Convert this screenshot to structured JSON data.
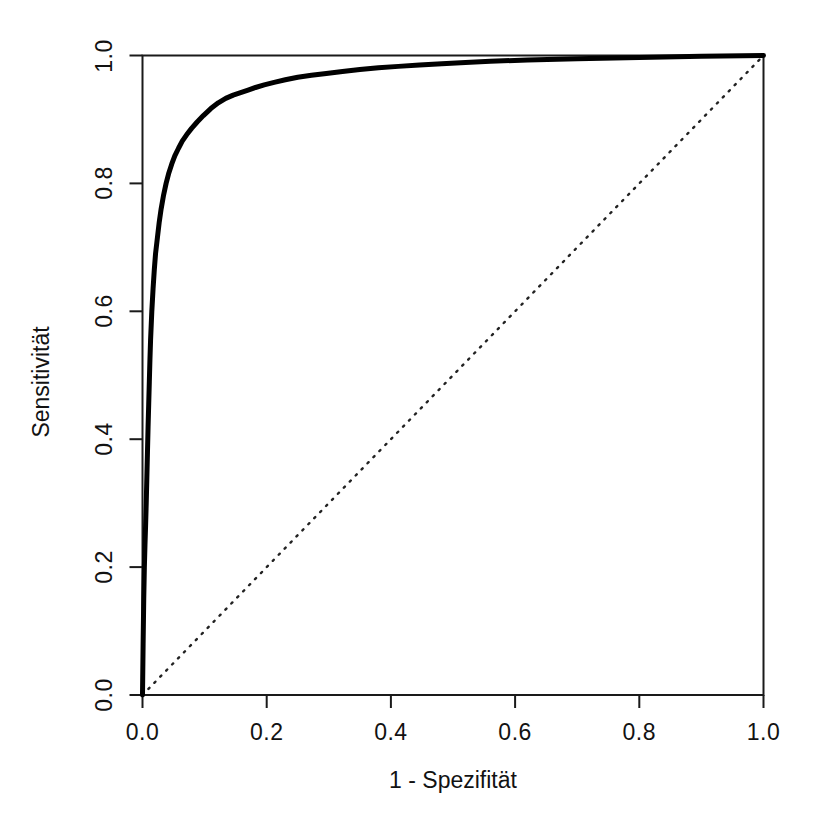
{
  "figure": {
    "background_color": "#ffffff",
    "foreground_color": "#121212"
  },
  "axes": {
    "x_title": "1 - Spezifität",
    "y_title": "Sensitivität",
    "x_ticks": [
      "0.0",
      "0.2",
      "0.4",
      "0.6",
      "0.8",
      "1.0"
    ],
    "y_ticks": [
      "0.0",
      "0.2",
      "0.4",
      "0.6",
      "0.8",
      "1.0"
    ]
  },
  "chart_data": {
    "type": "line",
    "title": "",
    "subtitle": "",
    "xlabel": "1 - Spezifität",
    "ylabel": "Sensitivität",
    "xlim": [
      0.0,
      1.0
    ],
    "ylim": [
      0.0,
      1.0
    ],
    "xticks": [
      0.0,
      0.2,
      0.4,
      0.6,
      0.8,
      1.0
    ],
    "yticks": [
      0.0,
      0.2,
      0.4,
      0.6,
      0.8,
      1.0
    ],
    "xticklabels": [
      "0.0",
      "0.2",
      "0.4",
      "0.6",
      "0.8",
      "1.0"
    ],
    "yticklabels": [
      "0.0",
      "0.2",
      "0.4",
      "0.6",
      "0.8",
      "1.0"
    ],
    "grid": false,
    "legend": null,
    "legend_position": "none",
    "annotations": [],
    "series": [
      {
        "name": "ROC-Kurve",
        "style": "solid",
        "color": "#000000",
        "line_width": 4,
        "x": [
          0.0,
          0.001,
          0.002,
          0.003,
          0.004,
          0.005,
          0.006,
          0.007,
          0.008,
          0.009,
          0.01,
          0.011,
          0.012,
          0.013,
          0.015,
          0.017,
          0.019,
          0.021,
          0.024,
          0.027,
          0.03,
          0.034,
          0.038,
          0.042,
          0.047,
          0.052,
          0.058,
          0.064,
          0.071,
          0.079,
          0.088,
          0.098,
          0.11,
          0.122,
          0.134,
          0.146,
          0.158,
          0.17,
          0.182,
          0.196,
          0.212,
          0.23,
          0.25,
          0.272,
          0.296,
          0.322,
          0.35,
          0.38,
          0.412,
          0.446,
          0.482,
          0.52,
          0.56,
          0.62,
          0.7,
          0.8,
          0.9,
          1.0
        ],
        "y": [
          0.0,
          0.08,
          0.15,
          0.2,
          0.235,
          0.265,
          0.3,
          0.34,
          0.38,
          0.42,
          0.455,
          0.49,
          0.525,
          0.555,
          0.6,
          0.635,
          0.665,
          0.69,
          0.715,
          0.74,
          0.76,
          0.782,
          0.8,
          0.815,
          0.83,
          0.843,
          0.855,
          0.866,
          0.876,
          0.886,
          0.896,
          0.906,
          0.917,
          0.926,
          0.933,
          0.938,
          0.942,
          0.946,
          0.95,
          0.954,
          0.958,
          0.962,
          0.966,
          0.969,
          0.972,
          0.975,
          0.978,
          0.981,
          0.983,
          0.985,
          0.987,
          0.989,
          0.991,
          0.993,
          0.995,
          0.997,
          0.999,
          1.0
        ]
      },
      {
        "name": "Referenzlinie",
        "style": "dotted",
        "color": "#222222",
        "line_width": 2,
        "x": [
          0.0,
          1.0
        ],
        "y": [
          0.0,
          1.0
        ]
      }
    ]
  }
}
